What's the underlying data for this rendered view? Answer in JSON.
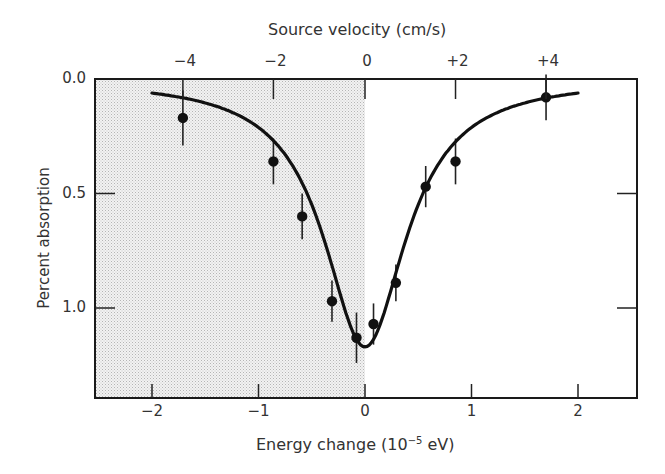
{
  "chart_data": {
    "type": "scatter",
    "title": "",
    "xlabel_prefix": "Energy change (10",
    "xlabel_exp": "−5",
    "xlabel_suffix": " eV)",
    "xlabel": "Energy change (10^-5 eV)",
    "ylabel": "Percent absorption",
    "top_xlabel": "Source velocity (cm/s)",
    "xlim": [
      -2.6,
      2.55
    ],
    "ylim": [
      0.0,
      1.4
    ],
    "y_inverted": true,
    "grid": false,
    "legend": null,
    "x_ticks": [
      -2,
      -1,
      0,
      1,
      2
    ],
    "x_tick_labels": [
      "−2",
      "−1",
      "0",
      "1",
      "2"
    ],
    "y_ticks": [
      0.0,
      0.5,
      1.0
    ],
    "y_tick_labels": [
      "0.0",
      "0.5",
      "1.0"
    ],
    "top_ticks_energy": [
      -1.71,
      -0.86,
      0.0,
      0.85,
      1.7
    ],
    "top_tick_labels": [
      "−4",
      "−2",
      "0",
      "+2",
      "+4"
    ],
    "shaded_region": {
      "x_from": -2.6,
      "x_to": 0.0,
      "description": "stippled region for negative energy change"
    },
    "series": [
      {
        "name": "measured",
        "kind": "scatter-errorbar",
        "x": [
          -1.71,
          -0.86,
          -0.59,
          -0.31,
          -0.08,
          0.08,
          0.29,
          0.57,
          0.85,
          1.7
        ],
        "y": [
          0.17,
          0.36,
          0.6,
          0.97,
          1.13,
          1.07,
          0.89,
          0.47,
          0.36,
          0.08
        ],
        "yerr": [
          0.12,
          0.1,
          0.1,
          0.09,
          0.11,
          0.09,
          0.08,
          0.09,
          0.1,
          0.1
        ]
      },
      {
        "name": "fit",
        "kind": "line",
        "model": "lorentzian",
        "center": 0.0,
        "depth": 1.17,
        "hwhm": 0.47,
        "x_range": [
          -2.0,
          2.0
        ]
      }
    ]
  }
}
